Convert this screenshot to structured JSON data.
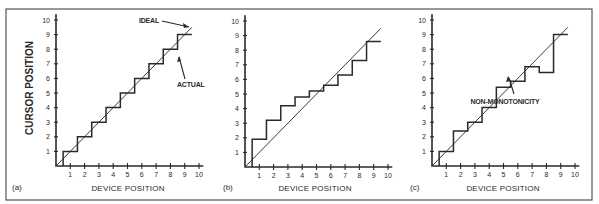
{
  "chart_data": [
    {
      "type": "line",
      "panel_label": "(a)",
      "title": "",
      "xlabel": "DEVICE POSITION",
      "ylabel": "CURSOR POSITION",
      "xlim": [
        0,
        10
      ],
      "ylim": [
        0,
        10
      ],
      "x_ticks": [
        "1",
        "2",
        "3",
        "4",
        "5",
        "6",
        "7",
        "8",
        "9",
        "10"
      ],
      "y_ticks": [
        "1",
        "2",
        "3",
        "4",
        "5",
        "6",
        "7",
        "8",
        "9",
        "10"
      ],
      "grid": false,
      "annotations": [
        "IDEAL",
        "ACTUAL"
      ],
      "series": [
        {
          "name": "IDEAL",
          "style": "line",
          "x": [
            0,
            9.5
          ],
          "y": [
            0,
            9.5
          ]
        },
        {
          "name": "ACTUAL",
          "style": "step",
          "step_edges": [
            0.5,
            1.5,
            2.5,
            3.5,
            4.5,
            5.5,
            6.5,
            7.5,
            8.5,
            9.5
          ],
          "levels": [
            1,
            2,
            3,
            4,
            5,
            6,
            7,
            8,
            9
          ]
        }
      ]
    },
    {
      "type": "line",
      "panel_label": "(b)",
      "title": "",
      "xlabel": "DEVICE POSITION",
      "ylabel": "",
      "xlim": [
        0,
        10
      ],
      "ylim": [
        0,
        10
      ],
      "x_ticks": [
        "1",
        "2",
        "3",
        "4",
        "5",
        "6",
        "7",
        "8",
        "9",
        "10"
      ],
      "y_ticks": [
        "1",
        "2",
        "3",
        "4",
        "5",
        "6",
        "7",
        "8",
        "9",
        "10"
      ],
      "grid": false,
      "annotations": [],
      "series": [
        {
          "name": "IDEAL",
          "style": "line",
          "x": [
            0,
            9.5
          ],
          "y": [
            0,
            9.5
          ]
        },
        {
          "name": "ACTUAL",
          "style": "step",
          "step_edges": [
            0.5,
            1.5,
            2.5,
            3.5,
            4.5,
            5.5,
            6.5,
            7.5,
            8.5,
            9.5
          ],
          "levels": [
            1.9,
            3.2,
            4.2,
            4.8,
            5.2,
            5.6,
            6.3,
            7.3,
            8.6
          ]
        }
      ]
    },
    {
      "type": "line",
      "panel_label": "(c)",
      "title": "",
      "xlabel": "DEVICE POSITION",
      "ylabel": "",
      "xlim": [
        0,
        10
      ],
      "ylim": [
        0,
        10
      ],
      "x_ticks": [
        "1",
        "2",
        "3",
        "4",
        "5",
        "6",
        "7",
        "8",
        "9",
        "10"
      ],
      "y_ticks": [
        "1",
        "2",
        "3",
        "4",
        "5",
        "6",
        "7",
        "8",
        "9",
        "10"
      ],
      "grid": false,
      "annotations": [
        "NON-MONOTONICITY"
      ],
      "series": [
        {
          "name": "IDEAL",
          "style": "line",
          "x": [
            0,
            9.5
          ],
          "y": [
            0,
            9.5
          ]
        },
        {
          "name": "ACTUAL",
          "style": "step",
          "step_edges": [
            0.5,
            1.5,
            2.5,
            3.5,
            4.5,
            5.5,
            6.5,
            7.5,
            8.5,
            9.5
          ],
          "levels": [
            1.0,
            2.4,
            3.0,
            4.0,
            5.4,
            5.8,
            6.8,
            6.4,
            9.0
          ]
        }
      ]
    }
  ],
  "labels": {
    "ylabel": "CURSOR POSITION",
    "xlabel": "DEVICE POSITION",
    "panel_a": "(a)",
    "panel_b": "(b)",
    "panel_c": "(c)",
    "ideal": "IDEAL",
    "actual": "ACTUAL",
    "non_monotonicity": "NON-MONOTONICITY"
  },
  "layout": {
    "frame": {
      "x": 6,
      "y": 9,
      "w": 586,
      "h": 191
    },
    "panels": [
      {
        "ox": 56,
        "oy": 166,
        "sx": 14.3,
        "sy": 14.6
      },
      {
        "ox": 245,
        "oy": 167,
        "sx": 14.3,
        "sy": 14.6
      },
      {
        "ox": 432,
        "oy": 166,
        "sx": 14.3,
        "sy": 14.6
      }
    ]
  }
}
